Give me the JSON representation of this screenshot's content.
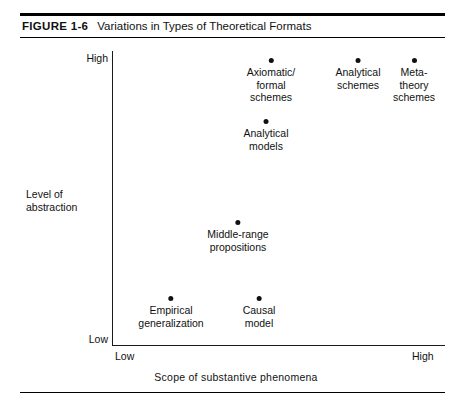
{
  "figure": {
    "number_label": "FIGURE 1-6",
    "title": "Variations in Types of Theoretical Formats"
  },
  "chart_data": {
    "type": "scatter",
    "title": "Variations in Types of Theoretical Formats",
    "xlabel": "Scope of substantive phenomena",
    "ylabel": "Level of abstraction",
    "x_tick_labels": [
      "Low",
      "High"
    ],
    "y_tick_labels": [
      "Low",
      "High"
    ],
    "xlim": [
      "Low",
      "High"
    ],
    "ylim": [
      "Low",
      "High"
    ],
    "grid": false,
    "legend": "none",
    "points": [
      {
        "label": "Axiomatic/ formal schemes",
        "lines": [
          "Axiomatic/",
          "formal",
          "schemes"
        ],
        "x": 0.475,
        "y": 0.97,
        "px": 271,
        "py": 60
      },
      {
        "label": "Analytical schemes",
        "lines": [
          "Analytical",
          "schemes"
        ],
        "x": 0.738,
        "y": 0.97,
        "px": 358,
        "py": 60
      },
      {
        "label": "Meta- theory schemes",
        "lines": [
          "Meta-",
          "theory",
          "schemes"
        ],
        "x": 0.906,
        "y": 0.97,
        "px": 414,
        "py": 60
      },
      {
        "label": "Analytical models",
        "lines": [
          "Analytical",
          "models"
        ],
        "x": 0.462,
        "y": 0.76,
        "px": 266,
        "py": 121
      },
      {
        "label": "Middle-range propositions",
        "lines": [
          "Middle-range",
          "propositions"
        ],
        "x": 0.378,
        "y": 0.42,
        "px": 238,
        "py": 222
      },
      {
        "label": "Empirical generalization",
        "lines": [
          "Empirical",
          "generalization"
        ],
        "x": 0.177,
        "y": 0.16,
        "px": 171,
        "py": 298
      },
      {
        "label": "Causal model",
        "lines": [
          "Causal",
          "model"
        ],
        "x": 0.441,
        "y": 0.16,
        "px": 259,
        "py": 298
      }
    ]
  },
  "colors": {
    "ink": "#111111",
    "rule": "#000000",
    "background": "#ffffff"
  }
}
